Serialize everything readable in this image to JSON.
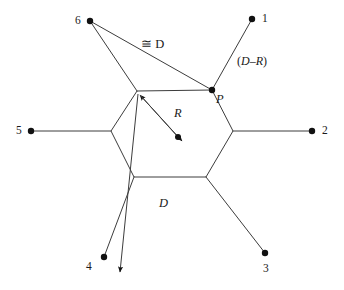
{
  "figure": {
    "type": "geometric-network-diagram",
    "background_color": "#ffffff",
    "line_color": "#3c3c3c",
    "node_color": "#111111"
  },
  "nodes": [
    {
      "id": "1",
      "label": "1",
      "x": 252,
      "y": 19,
      "label_x": 262,
      "label_y": 13
    },
    {
      "id": "2",
      "label": "2",
      "x": 312,
      "y": 131,
      "label_x": 322,
      "label_y": 125
    },
    {
      "id": "3",
      "label": "3",
      "x": 265,
      "y": 253,
      "label_x": 263,
      "label_y": 263
    },
    {
      "id": "4",
      "label": "4",
      "x": 104,
      "y": 257,
      "label_x": 86,
      "label_y": 261
    },
    {
      "id": "5",
      "label": "5",
      "x": 31,
      "y": 131,
      "label_x": 16,
      "label_y": 125
    },
    {
      "id": "6",
      "label": "6",
      "x": 90,
      "y": 21,
      "label_x": 75,
      "label_y": 15
    }
  ],
  "hexagon": {
    "vertices": [
      {
        "name": "top-left",
        "x": 137,
        "y": 91
      },
      {
        "name": "top-right-P",
        "x": 212,
        "y": 90
      },
      {
        "name": "right",
        "x": 233,
        "y": 131
      },
      {
        "name": "bottom-right",
        "x": 206,
        "y": 177
      },
      {
        "name": "bottom-left",
        "x": 134,
        "y": 177
      },
      {
        "name": "left",
        "x": 111,
        "y": 131
      }
    ]
  },
  "center_point": {
    "x": 178,
    "y": 137
  },
  "annotations": {
    "congruent_d": {
      "text": "≅ D",
      "symbol": "≅",
      "variable": "D",
      "x": 141,
      "y": 38
    },
    "d_minus_r": {
      "text": "(D–R)",
      "open": "(",
      "variable_d": "D",
      "dash": "–",
      "variable_r": "R",
      "close": ")",
      "x": 237,
      "y": 55
    },
    "point_p": {
      "text": "P",
      "x": 216,
      "y": 93
    },
    "radius_r": {
      "text": "R",
      "x": 174,
      "y": 107
    },
    "distance_d": {
      "text": "D",
      "x": 159,
      "y": 197
    }
  },
  "edges": [
    {
      "from": "node-1",
      "to": "vertex-top-right-P",
      "x1": 252,
      "y1": 19,
      "x2": 212,
      "y2": 90
    },
    {
      "from": "node-2",
      "to": "vertex-right",
      "x1": 312,
      "y1": 131,
      "x2": 233,
      "y2": 131
    },
    {
      "from": "node-3",
      "to": "vertex-bottom-right",
      "x1": 265,
      "y1": 253,
      "x2": 206,
      "y2": 177
    },
    {
      "from": "node-4",
      "to": "vertex-bottom-left",
      "x1": 104,
      "y1": 257,
      "x2": 134,
      "y2": 177
    },
    {
      "from": "node-5",
      "to": "vertex-left",
      "x1": 31,
      "y1": 131,
      "x2": 111,
      "y2": 131
    },
    {
      "from": "node-6",
      "to": "vertex-top-left",
      "x1": 90,
      "y1": 21,
      "x2": 137,
      "y2": 91
    },
    {
      "from": "node-6",
      "to": "vertex-top-right-P",
      "x1": 90,
      "y1": 21,
      "x2": 212,
      "y2": 90
    }
  ],
  "vectors": [
    {
      "name": "R-vector",
      "label": "R",
      "x1": 178,
      "y1": 137,
      "x2": 140,
      "y2": 95,
      "arrow_at": "end"
    },
    {
      "name": "R-vector-reverse",
      "x1": 140,
      "y1": 95,
      "x2": 182,
      "y2": 141,
      "arrow_at": "end"
    },
    {
      "name": "D-vector",
      "label": "D",
      "x1": 138,
      "y1": 94,
      "x2": 120,
      "y2": 272,
      "arrow_at": "end"
    }
  ]
}
